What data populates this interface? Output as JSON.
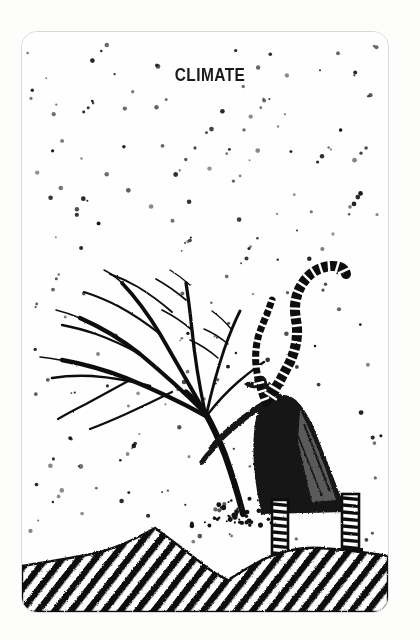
{
  "card": {
    "title": "Climate",
    "background_color": "#fefefe",
    "ink_color": "#111111",
    "border_color": "#d8d8d6",
    "border_radius_px": 16,
    "width_px": 420,
    "height_px": 640
  },
  "illustration": {
    "medium": "pen-and-ink line drawing",
    "subject": "figure in a long dark coat with a long striped scarf streaming in the wind, leaning forward while grasping a wind-bent bare tree on a snowy hillside",
    "elements": [
      {
        "name": "falling-snow",
        "description": "field of small black dots arranged along diagonal lines falling from upper-left to lower-right",
        "count": 210
      },
      {
        "name": "bare-tree",
        "description": "leafless tree bent hard to the left by the wind, trunk rising from the ground at the figure's feet with fanned branches"
      },
      {
        "name": "walking-figure",
        "description": "dark-coated person leaning into the wind, one arm extended down to the tree trunk"
      },
      {
        "name": "striped-scarf",
        "description": "long banded scarf lifting up and curling above the figure's head"
      },
      {
        "name": "striped-legs",
        "description": "two legs in horizontally banded stockings and dark boots"
      },
      {
        "name": "snow-spray",
        "description": "burst of dots kicked up at the base of the tree trunk"
      },
      {
        "name": "hatched-ground",
        "description": "snow hills rendered as a black silhouette filled with bold parallel diagonal hatching"
      }
    ],
    "palette": {
      "ink": "#111111",
      "paper": "#fefefe",
      "border": "#d8d8d6"
    }
  }
}
